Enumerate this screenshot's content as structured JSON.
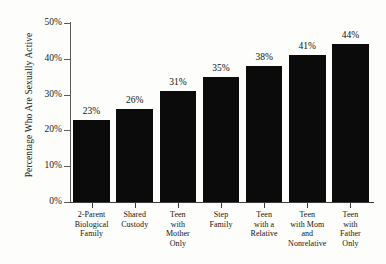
{
  "chart_data": {
    "type": "bar",
    "title": "",
    "xlabel": "",
    "ylabel": "Percentage Who Are Sexually Active",
    "categories": [
      "2-Parent Biological Family",
      "Shared Custody",
      "Teen with Mother Only",
      "Step Family",
      "Teen with a Relative",
      "Teen with Mom and Nonrelative",
      "Teen with Father Only"
    ],
    "category_lines": [
      [
        "2-Parent",
        "Biological",
        "Family"
      ],
      [
        "Shared",
        "Custody"
      ],
      [
        "Teen",
        "with",
        "Mother",
        "Only"
      ],
      [
        "Step",
        "Family"
      ],
      [
        "Teen",
        "with a",
        "Relative"
      ],
      [
        "Teen",
        "with Mom",
        "and",
        "Nonrelative"
      ],
      [
        "Teen",
        "with",
        "Father",
        "Only"
      ]
    ],
    "values": [
      23,
      26,
      31,
      35,
      38,
      41,
      44
    ],
    "value_labels": [
      "23%",
      "26%",
      "31%",
      "35%",
      "38%",
      "41%",
      "44%"
    ],
    "ylim": [
      0,
      50
    ],
    "yticks": [
      0,
      10,
      20,
      30,
      40,
      50
    ],
    "ytick_labels": [
      "0%",
      "10%",
      "20%",
      "30%",
      "40%",
      "50%"
    ],
    "grid": false,
    "legend": "none",
    "bar_color": "#0b0b0b",
    "axis_color": "#3a3a3a",
    "background_color": "#fdfdfb"
  }
}
